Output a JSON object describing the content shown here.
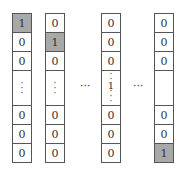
{
  "diagram": {
    "columns": [
      {
        "cells": [
          "1",
          "0",
          "0",
          "⋮",
          "0",
          "0",
          "0"
        ],
        "highlight_index": 0
      },
      {
        "cells": [
          "0",
          "1",
          "0",
          "⋮",
          "0",
          "0",
          "0"
        ],
        "highlight_index": 1
      },
      {
        "cells": [
          "0",
          "0",
          "0",
          "⋮1⋮",
          "0",
          "0",
          "0"
        ],
        "highlight_index": null
      },
      {
        "cells": [
          "0",
          "0",
          "0",
          "",
          "0",
          "0",
          "1"
        ],
        "highlight_index": 6
      }
    ],
    "separators": [
      "···",
      "···"
    ],
    "colors": {
      "highlight": "#a8a8a8",
      "border": "#555555",
      "background": "#ffffff"
    }
  }
}
